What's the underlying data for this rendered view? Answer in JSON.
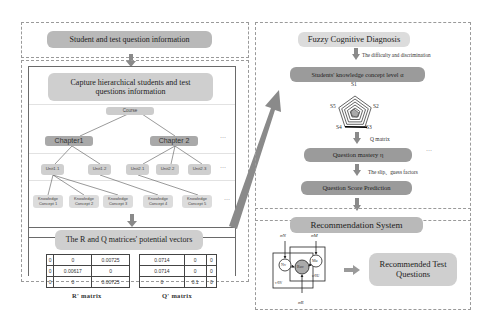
{
  "left_column": {
    "input_box": {
      "label": "Student and test question information"
    },
    "hierarchy_box": {
      "title": "Capture hierarchical students and test questions information",
      "course": "Course",
      "chapters": [
        "Chapter1",
        "Chapter 2"
      ],
      "units": [
        "Unit1.1",
        "Unit1.2",
        "Unit2.1",
        "Unit2.2",
        "Unit2.3"
      ],
      "knowledge_concepts": [
        "Knowledge Concept 1",
        "Knowledge Concept 2",
        "Knowledge Concept 3",
        "Knowledge Concept 4",
        "Knowledge Concept 5"
      ],
      "ellipsis": "···"
    },
    "matrices_box": {
      "title": "The R and Q matrices' potential vectors",
      "r_matrix": {
        "caption": "R' matrix",
        "rows": [
          [
            "0",
            "0",
            "0.00725"
          ],
          [
            "0",
            "0.00617",
            "0"
          ],
          [
            "0",
            "0",
            "0.00725"
          ]
        ]
      },
      "q_matrix": {
        "caption": "Q' matrix",
        "rows": [
          [
            "0.0714",
            "0",
            "0"
          ],
          [
            "0.0714",
            "0",
            "0"
          ],
          [
            "0",
            "0.1",
            "0"
          ]
        ]
      }
    }
  },
  "right_column": {
    "diagnosis_box": {
      "title": "Fuzzy Cognitive Diagnosis",
      "arrow_label_1": "The difficulty and discrimination",
      "knowledge_level": "Students' knowledge concept level α",
      "radar_labels": [
        "S1",
        "S2",
        "S3",
        "S4",
        "S5"
      ],
      "arrow_label_2": "Q  matrix",
      "question_mastery": "Question mastery η",
      "ellipsis": "···",
      "arrow_label_3": "The slip、guess factors",
      "score_prediction": "Question Score Prediction"
    },
    "recommendation_box": {
      "title": "Recommendation System",
      "model": {
        "sigma_n": "σN",
        "sigma_m": "σM",
        "sigma_r": "σR",
        "node_n": "Nv",
        "node_r": "Ruv",
        "node_m": "Mu",
        "plate_left": "v∈V",
        "plate_right": "u∈U"
      },
      "output": "Recommended Test Questions"
    }
  },
  "colors": {
    "pill_dark": "#9b9b9b",
    "pill_light": "#cfcfcf",
    "arrow": "#8a8a8a",
    "dash_border": "#9a9a9a"
  }
}
